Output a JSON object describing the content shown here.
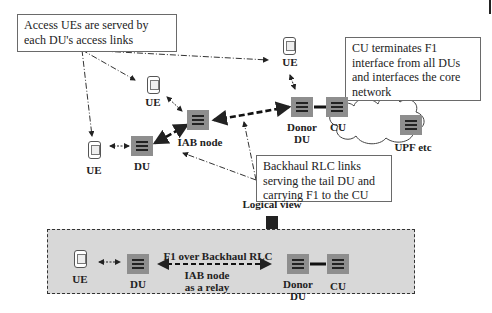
{
  "callouts": {
    "access": "Access UEs are served by each DU's  access links",
    "cu": "CU terminates F1 interface from all DUs and interfaces the core network",
    "backhaul": "Backhaul RLC links serving the tail DU and carrying F1 to the CU"
  },
  "physical": {
    "ue_top": "UE",
    "ue_left": "UE",
    "ue_bottom_left": "UE",
    "iab_node": "IAB node",
    "du": "DU",
    "donor_du_line1": "Donor",
    "donor_du_line2": "DU",
    "cu": "CU",
    "upf": "UPF etc"
  },
  "logical_view_label": "Logical view",
  "logical": {
    "ue": "UE",
    "du": "DU",
    "f1_label": "F1 over Backhaul RLC",
    "iab_relay_line1": "IAB node",
    "iab_relay_line2": "as a relay",
    "donor_du_line1": "Donor",
    "donor_du_line2": "DU",
    "cu": "CU"
  },
  "colors": {
    "node_fill": "#8e8e8e",
    "logical_box_fill": "#d8d8d8",
    "line": "#222222"
  }
}
